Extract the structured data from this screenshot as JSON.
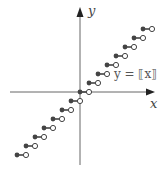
{
  "figure": {
    "equation_label": "y = ⟦x⟧",
    "x_axis_label": "x",
    "y_axis_label": "y",
    "colors": {
      "axis": "#666666",
      "filled_dot": "#444444",
      "open_dot_stroke": "#444444",
      "segment": "#444444"
    },
    "origin_px": [
      80,
      92
    ],
    "unit_px": 9,
    "steps": [
      {
        "n": -7,
        "closed_x": -7,
        "open_x": -6,
        "y": -7
      },
      {
        "n": -6,
        "closed_x": -6,
        "open_x": -5,
        "y": -6
      },
      {
        "n": -5,
        "closed_x": -5,
        "open_x": -4,
        "y": -5
      },
      {
        "n": -4,
        "closed_x": -4,
        "open_x": -3,
        "y": -4
      },
      {
        "n": -3,
        "closed_x": -3,
        "open_x": -2,
        "y": -3
      },
      {
        "n": -2,
        "closed_x": -2,
        "open_x": -1,
        "y": -2
      },
      {
        "n": -1,
        "closed_x": -1,
        "open_x": 0,
        "y": -1
      },
      {
        "n": 0,
        "closed_x": 0,
        "open_x": 1,
        "y": 0
      },
      {
        "n": 1,
        "closed_x": 1,
        "open_x": 2,
        "y": 1
      },
      {
        "n": 2,
        "closed_x": 2,
        "open_x": 3,
        "y": 2
      },
      {
        "n": 3,
        "closed_x": 3,
        "open_x": 4,
        "y": 3
      },
      {
        "n": 4,
        "closed_x": 4,
        "open_x": 5,
        "y": 4
      },
      {
        "n": 5,
        "closed_x": 5,
        "open_x": 6,
        "y": 5
      },
      {
        "n": 6,
        "closed_x": 6,
        "open_x": 7,
        "y": 6
      },
      {
        "n": 7,
        "closed_x": 7,
        "open_x": 8,
        "y": 7
      }
    ]
  }
}
